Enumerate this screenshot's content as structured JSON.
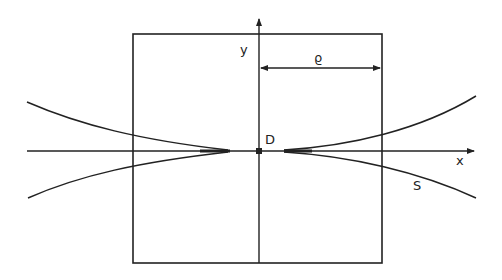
{
  "diagram": {
    "labels": {
      "y_axis": "y",
      "x_axis": "x",
      "origin": "D",
      "width_symbol": "ϱ",
      "curve": "S"
    },
    "colors": {
      "line": "#222222",
      "background": "#ffffff"
    },
    "geometry": {
      "box": {
        "left": 133,
        "top": 34,
        "right": 382,
        "bottom": 263
      },
      "origin": {
        "x": 259,
        "y": 151
      },
      "x_axis": {
        "x1": 27,
        "x2": 476
      },
      "y_axis": {
        "y1": 17,
        "y2": 263
      },
      "rho_dimension": {
        "x1": 259,
        "x2": 382,
        "y": 68
      }
    }
  }
}
